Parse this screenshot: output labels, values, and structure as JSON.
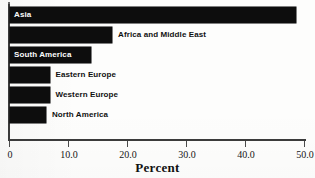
{
  "chart_data": {
    "type": "bar",
    "orientation": "horizontal",
    "title": "",
    "xlabel": "Percent",
    "ylabel": "",
    "categories": [
      "Asia",
      "Africa and Middle East",
      "South America",
      "Eastern Europe",
      "Western Europe",
      "North America"
    ],
    "values": [
      48.5,
      17.3,
      13.8,
      6.7,
      6.7,
      6.1
    ],
    "xlim": [
      0,
      50
    ],
    "xticks": [
      0,
      10,
      20,
      30,
      40,
      50
    ],
    "xtick_labels": [
      "0",
      "10.0",
      "20.0",
      "30.0",
      "40.0",
      "50.0"
    ],
    "grid": false,
    "legend": null,
    "bar_color": "#0d0d0d",
    "label_inside_color": "#ffffff",
    "label_outside_color": "#111111",
    "axis_color": "#3b3b3b"
  },
  "bars": [
    {
      "label": "Asia",
      "value": 48.5,
      "label_position": "inside"
    },
    {
      "label": "Africa and Middle East",
      "value": 17.3,
      "label_position": "outside"
    },
    {
      "label": "South America",
      "value": 13.8,
      "label_position": "inside"
    },
    {
      "label": "Eastern Europe",
      "value": 6.7,
      "label_position": "outside"
    },
    {
      "label": "Western Europe",
      "value": 6.7,
      "label_position": "outside"
    },
    {
      "label": "North America",
      "value": 6.1,
      "label_position": "outside"
    }
  ],
  "axis": {
    "title": "Percent",
    "ticks": [
      "0",
      "10.0",
      "20.0",
      "30.0",
      "40.0",
      "50.0"
    ]
  }
}
